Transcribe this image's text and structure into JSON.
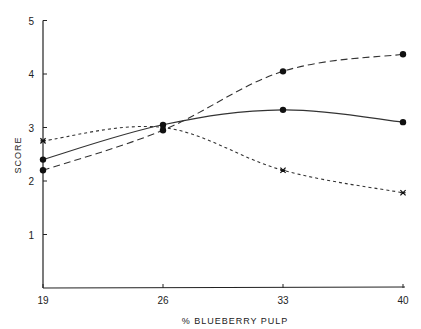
{
  "chart_data": {
    "type": "line",
    "title": "",
    "xlabel": "% BLUEBERRY PULP",
    "ylabel": "SCORE",
    "x": [
      19,
      26,
      33,
      40
    ],
    "x_tick_labels": [
      "19",
      "26",
      "33",
      "40"
    ],
    "y_tick_labels": [
      "1",
      "2",
      "3",
      "4",
      "5"
    ],
    "ylim": [
      0,
      5
    ],
    "grid": false,
    "legend": "none",
    "series": [
      {
        "name": "solid (filled circles)",
        "style": "solid",
        "marker": "circle",
        "values": [
          2.4,
          3.05,
          3.33,
          3.1
        ]
      },
      {
        "name": "long dash (filled circles)",
        "style": "long-dash",
        "marker": "circle",
        "values": [
          2.2,
          2.95,
          4.05,
          4.37
        ]
      },
      {
        "name": "short dash (x markers)",
        "style": "short-dash",
        "marker": "x",
        "values": [
          2.75,
          3.0,
          2.2,
          1.78
        ]
      }
    ]
  }
}
